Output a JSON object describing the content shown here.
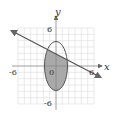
{
  "figure": {
    "axis_labels": {
      "x": "x",
      "y": "y"
    },
    "tick_labels": {
      "x_neg": "-6",
      "x_pos": "6",
      "y_pos": "6",
      "y_neg": "-6",
      "origin": "0"
    },
    "ellipse": {
      "center": [
        0,
        0
      ],
      "semi_x": 2,
      "semi_y": 4,
      "shaded_region": "inside ellipse below line"
    },
    "line": {
      "description": "decreasing line with arrows on both ends"
    },
    "colors": {
      "shade": "#a9a9a9",
      "grid": "#dcdcdc",
      "stroke": "#555555"
    }
  }
}
